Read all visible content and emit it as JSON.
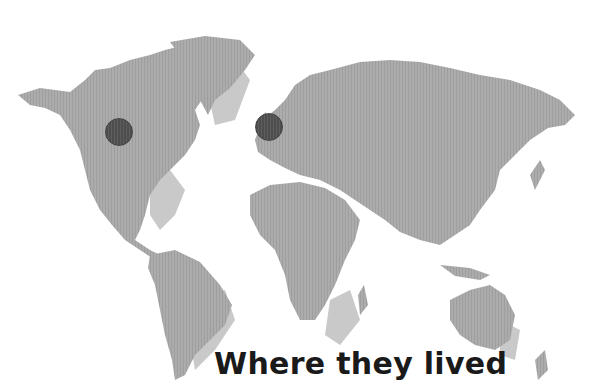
{
  "caption": "Where they lived",
  "colors": {
    "background": "#ffffff",
    "land": "#a9a9a9",
    "land_shadow": "#c9c9c9",
    "marker": "#555555",
    "caption_text": "#1a1a1a"
  },
  "markers": [
    {
      "label": "North America",
      "x": 118,
      "y": 131,
      "radius": 13
    },
    {
      "label": "Western Europe",
      "x": 268,
      "y": 126,
      "radius": 13
    }
  ]
}
